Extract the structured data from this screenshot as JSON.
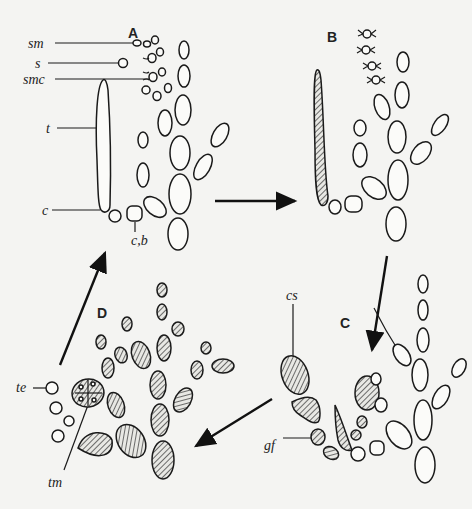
{
  "diagram": {
    "type": "life-cycle",
    "stages": [
      {
        "id": "A",
        "label": "A"
      },
      {
        "id": "B",
        "label": "B"
      },
      {
        "id": "C",
        "label": "C"
      },
      {
        "id": "D",
        "label": "D"
      }
    ],
    "labels": {
      "sm": "sm",
      "s": "s",
      "smc": "smc",
      "t": "t",
      "c": "c",
      "cb": "c,b",
      "cs": "cs",
      "gf": "gf",
      "te": "te",
      "tm": "tm"
    },
    "flow": [
      "A → B",
      "B → C",
      "C → D",
      "D → A"
    ],
    "colors": {
      "background": "#f4f4f2",
      "ink": "#1a1a1a"
    }
  }
}
